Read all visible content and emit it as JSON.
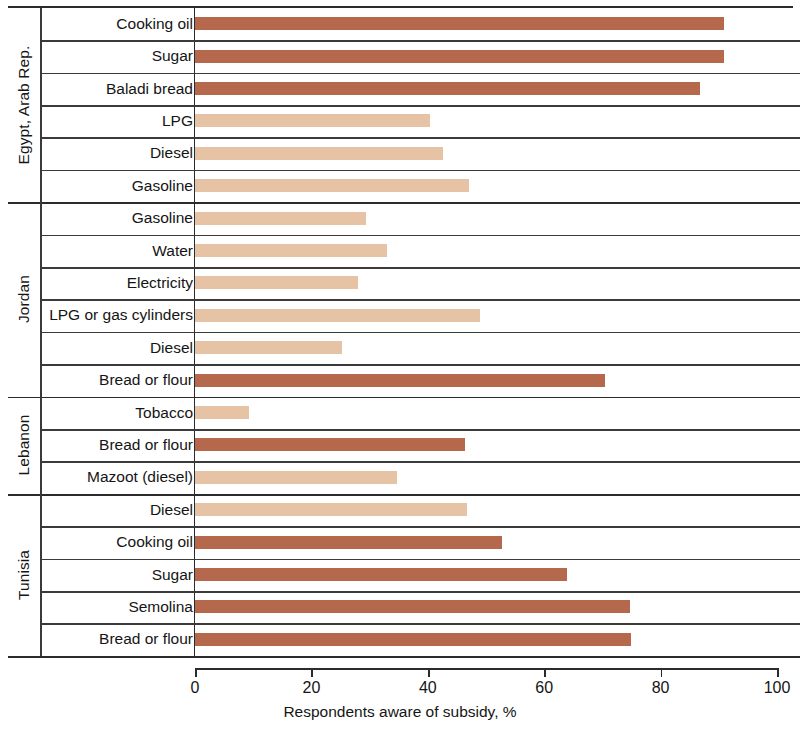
{
  "chart_data": {
    "type": "bar",
    "orientation": "horizontal",
    "title": "",
    "xlabel": "Respondents aware of subsidy, %",
    "ylabel": "",
    "xlim": [
      0,
      100
    ],
    "xticks": [
      0,
      20,
      40,
      60,
      80,
      100
    ],
    "grid": false,
    "legend": null,
    "colors": {
      "food_subsidy": "#b5684b",
      "energy_or_other_subsidy": "#e7c3a6",
      "axis": "#2b2b2b",
      "background": "#ffffff"
    },
    "groups": [
      {
        "name": "Egypt, Arab Rep.",
        "items": [
          {
            "label": "Cooking oil",
            "value": 90.9,
            "color_key": "food_subsidy"
          },
          {
            "label": "Sugar",
            "value": 90.9,
            "color_key": "food_subsidy"
          },
          {
            "label": "Baladi bread",
            "value": 86.8,
            "color_key": "food_subsidy"
          },
          {
            "label": "LPG",
            "value": 40.4,
            "color_key": "energy_or_other_subsidy"
          },
          {
            "label": "Diesel",
            "value": 42.6,
            "color_key": "energy_or_other_subsidy"
          },
          {
            "label": "Gasoline",
            "value": 47.0,
            "color_key": "energy_or_other_subsidy"
          }
        ]
      },
      {
        "name": "Jordan",
        "items": [
          {
            "label": "Gasoline",
            "value": 29.4,
            "color_key": "energy_or_other_subsidy"
          },
          {
            "label": "Water",
            "value": 33.0,
            "color_key": "energy_or_other_subsidy"
          },
          {
            "label": "Electricity",
            "value": 28.0,
            "color_key": "energy_or_other_subsidy"
          },
          {
            "label": "LPG or gas cylinders",
            "value": 49.0,
            "color_key": "energy_or_other_subsidy"
          },
          {
            "label": "Diesel",
            "value": 25.3,
            "color_key": "energy_or_other_subsidy"
          },
          {
            "label": "Bread or flour",
            "value": 70.4,
            "color_key": "food_subsidy"
          }
        ]
      },
      {
        "name": "Lebanon",
        "items": [
          {
            "label": "Tobacco",
            "value": 9.3,
            "color_key": "energy_or_other_subsidy"
          },
          {
            "label": "Bread or flour",
            "value": 46.4,
            "color_key": "food_subsidy"
          },
          {
            "label": "Mazoot (diesel)",
            "value": 34.7,
            "color_key": "energy_or_other_subsidy"
          }
        ]
      },
      {
        "name": "Tunisia",
        "items": [
          {
            "label": "Diesel",
            "value": 46.7,
            "color_key": "energy_or_other_subsidy"
          },
          {
            "label": "Cooking oil",
            "value": 52.7,
            "color_key": "food_subsidy"
          },
          {
            "label": "Sugar",
            "value": 63.9,
            "color_key": "food_subsidy"
          },
          {
            "label": "Semolina",
            "value": 74.7,
            "color_key": "food_subsidy"
          },
          {
            "label": "Bread or flour",
            "value": 74.9,
            "color_key": "food_subsidy"
          }
        ]
      }
    ]
  }
}
